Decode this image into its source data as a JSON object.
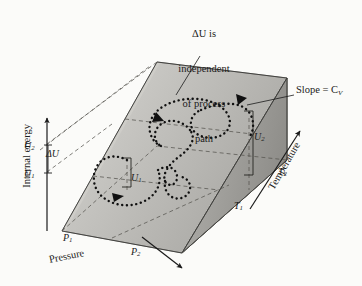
{
  "figure": {
    "background_color": "#fbfbf9",
    "ink_color": "#1b1b1b"
  },
  "annotation": {
    "note_lines": [
      "ΔU is",
      "independent",
      "of process",
      "path"
    ],
    "note_text": "ΔU is independent of process path",
    "slope_label": "Slope = C",
    "slope_subscript": "V"
  },
  "axes": {
    "vertical": {
      "name": "internal-energy",
      "label": "Internal energy",
      "ticks": [
        {
          "id": "u2",
          "text": "U",
          "sub": "2"
        },
        {
          "id": "u1",
          "text": "U",
          "sub": "1"
        }
      ],
      "delta_label": "ΔU"
    },
    "horizontal": {
      "name": "pressure",
      "label": "Pressure",
      "ticks": [
        {
          "id": "p1",
          "text": "P",
          "sub": "1"
        },
        {
          "id": "p2",
          "text": "P",
          "sub": "2"
        }
      ]
    },
    "depth": {
      "name": "temperature",
      "label": "Temperature",
      "ticks": [
        {
          "id": "t1",
          "text": "T",
          "sub": "1"
        },
        {
          "id": "t2",
          "text": "T",
          "sub": "2"
        }
      ]
    }
  },
  "surface_markers": [
    {
      "id": "u1",
      "text": "U",
      "sub": "1"
    },
    {
      "id": "u2",
      "text": "U",
      "sub": "2"
    }
  ],
  "colors": {
    "surface_top_light": "#d5d4d0",
    "surface_top_mid": "#bcbbb7",
    "surface_top_dark": "#a9a8a4",
    "end_face": "#8f8e8a",
    "base_face": "#e7e6e2",
    "side_triangle": "#9d9c98",
    "stroke": "#2a2a28",
    "dashed": "#4a4a48",
    "path_dots": "#111111"
  },
  "path": {
    "description": "dotted spiral process path from state 1 to state 2",
    "arrow_count": 3
  }
}
